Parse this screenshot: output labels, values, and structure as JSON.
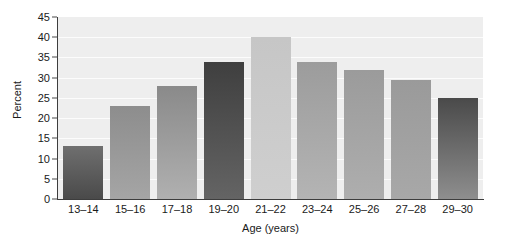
{
  "chart_data": {
    "type": "bar",
    "title": "",
    "xlabel": "Age (years)",
    "ylabel": "Percent",
    "categories": [
      "13–14",
      "15–16",
      "17–18",
      "19–20",
      "21–22",
      "23–24",
      "25–26",
      "27–28",
      "29–30"
    ],
    "values": [
      13,
      23,
      28,
      34,
      40,
      34,
      32,
      29.5,
      25
    ],
    "ylim": [
      0,
      45
    ],
    "ytick_labels": [
      "0",
      "5",
      "10",
      "15",
      "20",
      "25",
      "30",
      "35",
      "40",
      "45"
    ],
    "ytick_values": [
      0,
      5,
      10,
      15,
      20,
      25,
      30,
      35,
      40,
      45
    ],
    "grid": true,
    "legend": "none",
    "bar_colors_top": [
      "#6f6f6f",
      "#8d8d8d",
      "#8a8a8a",
      "#3f3f3f",
      "#c6c6c6",
      "#9c9c9c",
      "#9b9b9b",
      "#9a9a9a",
      "#4a4a4a"
    ],
    "bar_colors_bottom": [
      "#4a4a4a",
      "#a5a5a5",
      "#b0b0b0",
      "#646464",
      "#cfcfcf",
      "#b4b4b4",
      "#aeaeae",
      "#a8a8a8",
      "#8e8e8e"
    ],
    "plot_background": "#eeeeee",
    "gridline_color": "#fcfcfc",
    "axis_color": "#3d3d3d",
    "text_color": "#1a1a1a"
  }
}
